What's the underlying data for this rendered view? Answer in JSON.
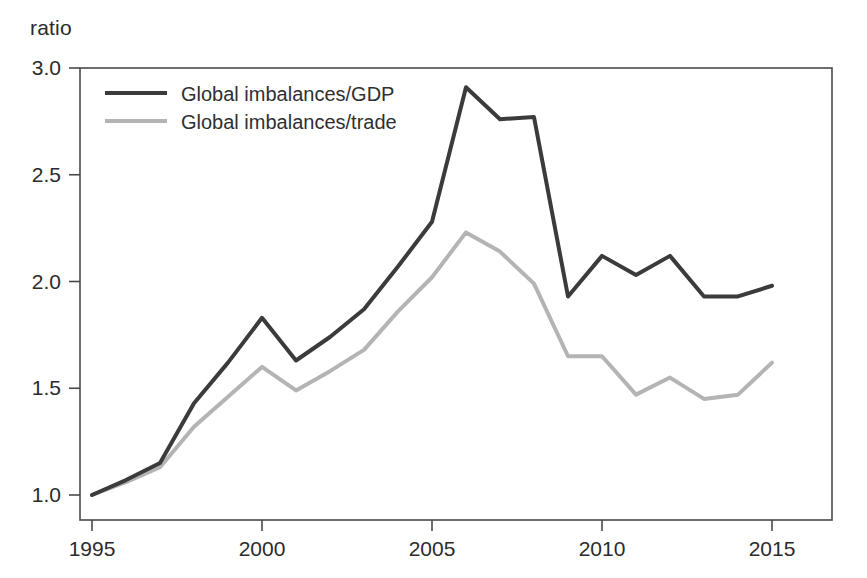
{
  "figure": {
    "y_axis_unit_label": "ratio"
  },
  "chart_data": {
    "type": "line",
    "title": "",
    "subtitle": "",
    "xlabel": "",
    "ylabel": "ratio",
    "grid": false,
    "legend_position": "top-left-inside",
    "xlim": [
      1995,
      2015
    ],
    "ylim": [
      1.0,
      3.0
    ],
    "xticks": [
      1995,
      2000,
      2005,
      2010,
      2015
    ],
    "xtick_labels": [
      "1995",
      "2000",
      "2005",
      "2010",
      "2015"
    ],
    "yticks": [
      1.0,
      1.5,
      2.0,
      2.5,
      3.0
    ],
    "ytick_labels": [
      "1.0",
      "1.5",
      "2.0",
      "2.5",
      "3.0"
    ],
    "x": [
      1995,
      1996,
      1997,
      1998,
      1999,
      2000,
      2001,
      2002,
      2003,
      2004,
      2005,
      2006,
      2007,
      2008,
      2009,
      2010,
      2011,
      2012,
      2013,
      2014,
      2015
    ],
    "series": [
      {
        "name": "Global imbalances/GDP",
        "color": "#3b3b3b",
        "width": 4,
        "values": [
          1.0,
          1.07,
          1.15,
          1.43,
          1.62,
          1.83,
          1.63,
          1.74,
          1.87,
          2.07,
          2.28,
          2.91,
          2.76,
          2.77,
          1.93,
          2.12,
          2.03,
          2.12,
          1.93,
          1.93,
          1.98
        ]
      },
      {
        "name": "Global imbalances/trade",
        "color": "#b4b4b4",
        "width": 4,
        "values": [
          1.0,
          1.06,
          1.13,
          1.32,
          1.46,
          1.6,
          1.49,
          1.58,
          1.68,
          1.86,
          2.02,
          2.23,
          2.14,
          1.99,
          1.65,
          1.65,
          1.47,
          1.55,
          1.45,
          1.47,
          1.62
        ]
      }
    ],
    "annotations": []
  },
  "legend": {
    "entries": [
      {
        "label": "Global imbalances/GDP"
      },
      {
        "label": "Global imbalances/trade"
      }
    ]
  },
  "colors": {
    "series_gdp": "#3b3b3b",
    "series_trade": "#b4b4b4",
    "axis": "#4a4a4a",
    "text": "#2b2b2b",
    "background": "#ffffff"
  }
}
